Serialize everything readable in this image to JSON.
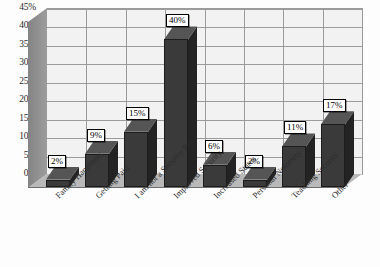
{
  "chart_data": {
    "type": "bar",
    "title": "",
    "subtitle": "",
    "xlabel": "",
    "ylabel": "",
    "ylim": [
      0,
      45
    ],
    "grid": true,
    "legend": "none",
    "style": "3d-column",
    "categories": [
      "Family Happiness",
      "Getting Paid",
      "I am not a Security Pro",
      "Improved Security",
      "Increased Status",
      "Personal Notoriety",
      "Teaching Security",
      "Other"
    ],
    "values": [
      2,
      9,
      15,
      40,
      6,
      2,
      11,
      17
    ],
    "data_labels": [
      "2%",
      "9%",
      "15%",
      "40%",
      "6%",
      "2%",
      "11%",
      "17%"
    ],
    "yticks": [
      0,
      5,
      10,
      15,
      20,
      25,
      30,
      35,
      40,
      45
    ],
    "ytick_labels": [
      "0%",
      "5%",
      "10%",
      "15%",
      "20%",
      "25%",
      "30%",
      "35%",
      "40%",
      "45%"
    ],
    "colors": {
      "bar_front": "#3a3a3a",
      "bar_top": "#555555",
      "bar_side": "#232323",
      "plot_background": "#f2f2f2",
      "gridline": "#9b9b9b",
      "wall": "#8d8d8d",
      "floor": "#b9b9b9",
      "label_background": "#ffffff",
      "label_border": "#000000",
      "text": "#2b2b2b"
    }
  }
}
